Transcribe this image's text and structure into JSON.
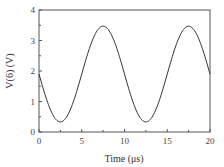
{
  "chart_data": {
    "type": "line",
    "title": "",
    "xlabel": "Time (μs)",
    "ylabel": "V(6)  (V)",
    "xlim": [
      0,
      20
    ],
    "ylim": [
      0,
      4
    ],
    "xticks": [
      0,
      5,
      10,
      15,
      20
    ],
    "yticks": [
      0,
      1,
      2,
      3,
      4
    ],
    "grid": false,
    "legend": null,
    "series": [
      {
        "name": "V(6)",
        "x": [
          0,
          1,
          2,
          2.5,
          3,
          4,
          5,
          6,
          7,
          7.5,
          8,
          9,
          10,
          11,
          12,
          12.5,
          13,
          14,
          15,
          16,
          17,
          17.5,
          18,
          19,
          20
        ],
        "y": [
          1.9,
          0.98,
          0.41,
          0.33,
          0.41,
          0.98,
          1.9,
          2.82,
          3.39,
          3.47,
          3.39,
          2.82,
          1.9,
          0.98,
          0.41,
          0.33,
          0.41,
          0.98,
          1.9,
          2.82,
          3.39,
          3.47,
          3.39,
          2.82,
          1.9
        ]
      }
    ]
  },
  "axes": {
    "x_tick_labels": [
      "0",
      "5",
      "10",
      "15",
      "20"
    ],
    "y_tick_labels": [
      "0",
      "1",
      "2",
      "3",
      "4"
    ],
    "xlabel": "Time (μs)",
    "ylabel": "V(6)  (V)"
  },
  "colors": {
    "line": "#333333",
    "frame": "#555555"
  }
}
